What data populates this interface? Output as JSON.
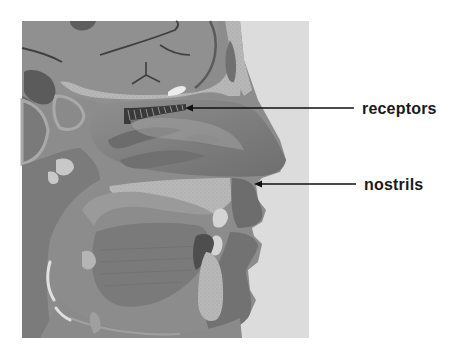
{
  "figure": {
    "colors": {
      "background": "#ffffff",
      "skin_outside": "#dcdcdc",
      "bone": "#a9a9a9",
      "tissue_mid": "#8a8a8a",
      "tissue_dark": "#6b6b6b",
      "cavity_dark": "#555555",
      "cartilage_light": "#bdbdbd",
      "highlight": "#e6e6e6",
      "label_text": "#1a1a1a",
      "leader_line": "#111111"
    }
  },
  "labels": [
    {
      "id": "receptors",
      "text": "receptors",
      "arrow_tip": [
        185,
        108
      ],
      "line_end": [
        354,
        108
      ]
    },
    {
      "id": "nostrils",
      "text": "nostrils",
      "arrow_tip": [
        254,
        184
      ],
      "line_end": [
        356,
        184
      ]
    }
  ]
}
